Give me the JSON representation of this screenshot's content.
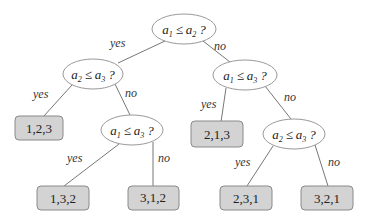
{
  "diagram": {
    "type": "decision-tree",
    "nodes": {
      "root": {
        "lhs": "a",
        "lhs_sub": "1",
        "op": "≤",
        "rhs": "a",
        "rhs_sub": "2",
        "q": "?"
      },
      "left": {
        "lhs": "a",
        "lhs_sub": "2",
        "op": "≤",
        "rhs": "a",
        "rhs_sub": "3",
        "q": "?"
      },
      "right": {
        "lhs": "a",
        "lhs_sub": "1",
        "op": "≤",
        "rhs": "a",
        "rhs_sub": "3",
        "q": "?"
      },
      "left_no": {
        "lhs": "a",
        "lhs_sub": "1",
        "op": "≤",
        "rhs": "a",
        "rhs_sub": "3",
        "q": "?"
      },
      "right_no": {
        "lhs": "a",
        "lhs_sub": "2",
        "op": "≤",
        "rhs": "a",
        "rhs_sub": "3",
        "q": "?"
      }
    },
    "leaves": {
      "l1": "1,2,3",
      "l2": "1,3,2",
      "l3": "3,1,2",
      "l4": "2,1,3",
      "l5": "2,3,1",
      "l6": "3,2,1"
    },
    "edge_labels": {
      "yes": "yes",
      "no": "no"
    },
    "colors": {
      "leaf_fill": "#d3d3d3",
      "leaf_border": "#8a8a8a",
      "edge": "#777777",
      "node_border": "#999999"
    }
  }
}
